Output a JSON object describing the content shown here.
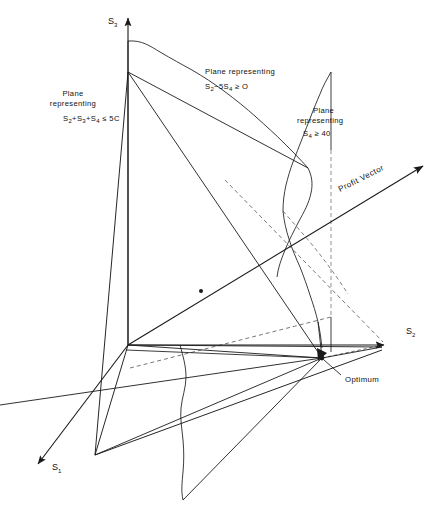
{
  "figure": {
    "kind": "3d-linear-programming-feasible-region",
    "background_color": "#ffffff",
    "line_color": "#1a1a1a",
    "width": 436,
    "height": 524
  },
  "axes": [
    {
      "name": "s3-axis",
      "label": "S",
      "subscript": "3",
      "direction": "up",
      "label_x": 108,
      "label_y": 22
    },
    {
      "name": "s2-axis",
      "label": "S",
      "subscript": "2",
      "direction": "right",
      "label_x": 406,
      "label_y": 332
    },
    {
      "name": "s1-axis",
      "label": "S",
      "subscript": "1",
      "direction": "down-left",
      "label_x": 32,
      "label_y": 468
    }
  ],
  "plane_labels": [
    {
      "name": "plane-label-capacity",
      "line1": "Plane",
      "line2": "representing",
      "formula_parts": [
        "S",
        "2",
        "+S",
        "3",
        "+S",
        "4",
        " ",
        "≤",
        " 5C"
      ],
      "formula_plain": "S2+S3+S4 ≤ 5C",
      "line1_x": 73,
      "line1_y": 95,
      "line2_x": 73,
      "line2_y": 105,
      "formula_x": 63,
      "formula_y": 120
    },
    {
      "name": "plane-label-ratio",
      "line1": "Plane representing",
      "line2": "",
      "formula_plain": "S2−5S4 ≥ O",
      "line1_x": 205,
      "line1_y": 73,
      "formula_x": 202,
      "formula_y": 88
    },
    {
      "name": "plane-label-minimum",
      "line1": "Plane",
      "line2": "representing",
      "formula_plain": "S4 ≥ 40",
      "line1_x": 313,
      "line1_y": 112,
      "line2_x": 313,
      "line2_y": 122,
      "formula_x": 313,
      "formula_y": 135
    }
  ],
  "annotations": [
    {
      "name": "profit-vector-label",
      "text": "Profit Vector",
      "x": 340,
      "y": 192,
      "rotation": -27
    },
    {
      "name": "optimum-label",
      "text": "Optimum",
      "x": 345,
      "y": 381,
      "leader_from_x": 341,
      "leader_from_y": 375,
      "leader_to_x": 324,
      "leader_to_y": 360
    }
  ],
  "points": [
    {
      "name": "profit-vector-marker",
      "x": 201,
      "y": 291,
      "r": 2
    },
    {
      "name": "optimum-vertex",
      "x": 322,
      "y": 358,
      "r": 2.4
    }
  ],
  "origin": {
    "x": 128,
    "y": 345
  }
}
